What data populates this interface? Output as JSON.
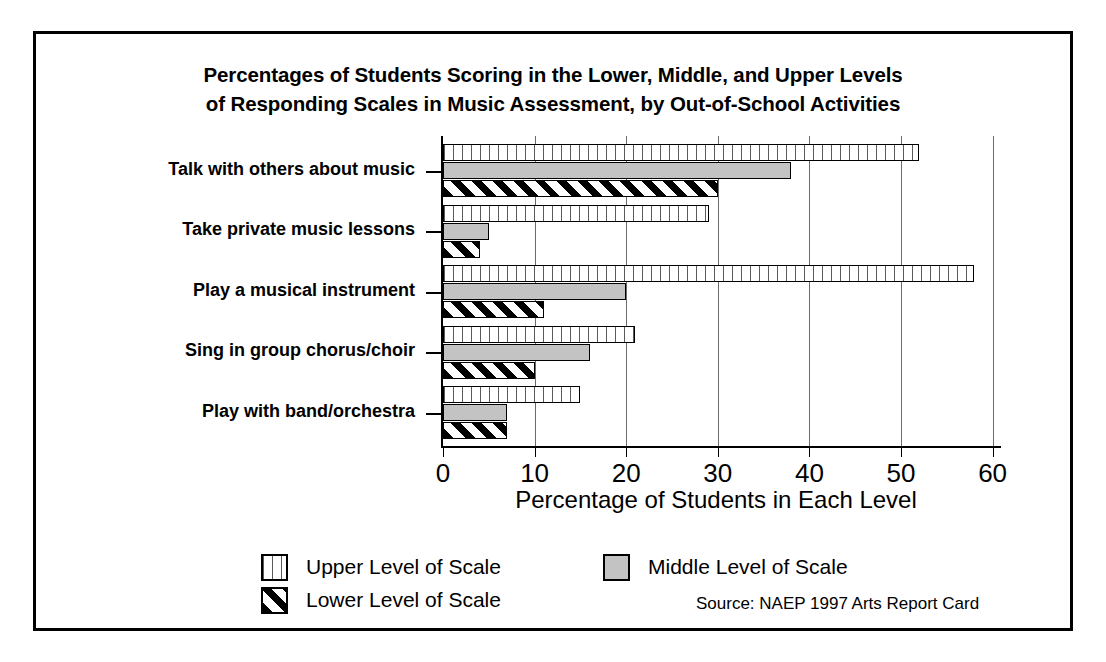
{
  "chart_data": {
    "type": "bar",
    "orientation": "horizontal",
    "title": "Percentages of Students Scoring in the Lower, Middle, and Upper Levels of Responding Scales in Music Assessment, by Out-of-School Activities",
    "title_lines": [
      "Percentages of Students Scoring in the Lower, Middle, and Upper Levels",
      "of Responding Scales in Music Assessment, by Out-of-School Activities"
    ],
    "xlabel": "Percentage of Students in Each Level",
    "ylabel": "",
    "xlim": [
      0,
      60
    ],
    "xticks": [
      0,
      10,
      20,
      30,
      40,
      50,
      60
    ],
    "xticklabels": [
      "0",
      "10",
      "20",
      "30",
      "40",
      "50",
      "60"
    ],
    "grid": true,
    "grid_axis": "x",
    "legend_position": "bottom",
    "categories": [
      "Talk with others about music",
      "Take private music lessons",
      "Play a musical instrument",
      "Sing in group chorus/choir",
      "Play with band/orchestra"
    ],
    "series": [
      {
        "name": "Upper Level of Scale",
        "pattern": "vertical-lines",
        "color": "#ffffff",
        "values": [
          52,
          29,
          58,
          21,
          15
        ]
      },
      {
        "name": "Middle Level of Scale",
        "pattern": "solid-gray",
        "color": "#c3c3c3",
        "values": [
          38,
          5,
          20,
          16,
          7
        ]
      },
      {
        "name": "Lower Level of Scale",
        "pattern": "diagonal-hatch",
        "color": "#000000",
        "values": [
          30,
          4,
          11,
          10,
          7
        ]
      }
    ],
    "source": "Source: NAEP 1997 Arts Report Card"
  },
  "legend": {
    "items": [
      {
        "label": "Upper Level of Scale"
      },
      {
        "label": "Middle Level of Scale"
      },
      {
        "label": "Lower Level of Scale"
      }
    ]
  }
}
